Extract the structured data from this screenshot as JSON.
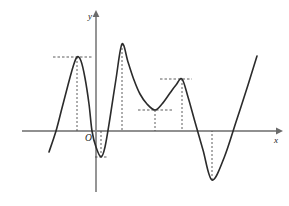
{
  "figure": {
    "title": "",
    "axis_labels": {
      "x": "x",
      "y": "y"
    },
    "origin_label": "O",
    "colors": {
      "background": "#ffffff",
      "curve": "#2b2b2b",
      "axis": "#6b6b6b",
      "guide": "#4a4a4a",
      "text": "#1a1a1a"
    }
  },
  "chart_data": {
    "type": "line",
    "title": "",
    "xlabel": "x",
    "ylabel": "y",
    "grid": false,
    "legend": "none",
    "axes": {
      "x_axis_pixel_y": 131,
      "y_axis_pixel_x": 96,
      "x_axis_from": 22,
      "x_axis_to": 278,
      "y_axis_top": 13,
      "y_axis_bottom": 192,
      "arrow_x": true,
      "arrow_y": true
    },
    "curve_points": [
      [
        49,
        152
      ],
      [
        56,
        131
      ],
      [
        62,
        108
      ],
      [
        68,
        85
      ],
      [
        73,
        67
      ],
      [
        77,
        57
      ],
      [
        81,
        61
      ],
      [
        85,
        78
      ],
      [
        89,
        104
      ],
      [
        92,
        131
      ],
      [
        96,
        147
      ],
      [
        101,
        157
      ],
      [
        105,
        147
      ],
      [
        110,
        118
      ],
      [
        116,
        79
      ],
      [
        122,
        44
      ],
      [
        128,
        62
      ],
      [
        134,
        80
      ],
      [
        140,
        94
      ],
      [
        147,
        104
      ],
      [
        155,
        110
      ],
      [
        162,
        104
      ],
      [
        170,
        93
      ],
      [
        176,
        85
      ],
      [
        182,
        79
      ],
      [
        188,
        97
      ],
      [
        195,
        122
      ],
      [
        203,
        150
      ],
      [
        212,
        180
      ],
      [
        224,
        158
      ],
      [
        236,
        122
      ],
      [
        248,
        85
      ],
      [
        257,
        56
      ]
    ],
    "extrema": [
      {
        "kind": "local-max",
        "x": 77,
        "y": 57,
        "guide_h": [
          53,
          92
        ],
        "guide_v_to": 131
      },
      {
        "kind": "local-min",
        "x": 101,
        "y": 157,
        "guide_h": [
          95,
          108
        ],
        "guide_v_to": 131
      },
      {
        "kind": "local-max",
        "x": 122,
        "y": 44,
        "guide_h": null,
        "guide_v_to": 131
      },
      {
        "kind": "local-min",
        "x": 155,
        "y": 110,
        "guide_h": [
          138,
          172
        ],
        "guide_v_to": 131
      },
      {
        "kind": "local-max",
        "x": 182,
        "y": 79,
        "guide_h": [
          160,
          192
        ],
        "guide_v_to": 131
      },
      {
        "kind": "local-min",
        "x": 212,
        "y": 180,
        "guide_h": null,
        "guide_v_to": 131
      }
    ],
    "x_intercepts_pixel": [
      56,
      92,
      106,
      196,
      232
    ]
  }
}
